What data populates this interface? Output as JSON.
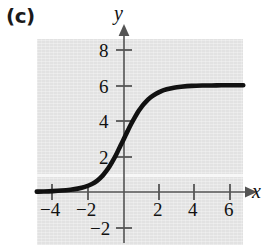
{
  "figure": {
    "panel_label": "(c)",
    "background_color": "#ffffff",
    "plot_background_color": "#e2e2e2",
    "curve_color": "#111111",
    "axis_color": "#555555"
  },
  "axes": {
    "x_name": "x",
    "y_name": "y",
    "x_ticks": [
      {
        "value": -4,
        "label": "−4"
      },
      {
        "value": -2,
        "label": "−2"
      },
      {
        "value": 2,
        "label": "2"
      },
      {
        "value": 4,
        "label": "4"
      },
      {
        "value": 6,
        "label": "6"
      }
    ],
    "y_ticks": [
      {
        "value": 8,
        "label": "8"
      },
      {
        "value": 6,
        "label": "6"
      },
      {
        "value": 4,
        "label": "4"
      },
      {
        "value": 2,
        "label": "2"
      },
      {
        "value": -2,
        "label": "−2"
      }
    ]
  },
  "chart_data": {
    "type": "line",
    "title": "(c)",
    "xlabel": "x",
    "ylabel": "y",
    "xlim": [
      -4.9,
      6.7
    ],
    "ylim": [
      -2.9,
      8.6
    ],
    "grid": false,
    "legend": null,
    "annotations": [],
    "asymptotes": {
      "lower": 0,
      "upper": 6
    },
    "y_intercept": 2.3,
    "series": [
      {
        "name": "logistic curve",
        "x": [
          -4.9,
          -4.5,
          -4.0,
          -3.5,
          -3.0,
          -2.6,
          -2.2,
          -1.8,
          -1.5,
          -1.2,
          -1.0,
          -0.8,
          -0.6,
          -0.4,
          -0.2,
          0.0,
          0.2,
          0.4,
          0.6,
          0.8,
          1.0,
          1.2,
          1.5,
          1.8,
          2.1,
          2.4,
          2.8,
          3.2,
          3.8,
          4.4,
          5.2,
          6.0,
          6.7
        ],
        "y": [
          0.02,
          0.03,
          0.05,
          0.08,
          0.13,
          0.19,
          0.29,
          0.45,
          0.64,
          0.92,
          1.17,
          1.46,
          1.8,
          2.18,
          2.6,
          3.0,
          3.42,
          3.82,
          4.18,
          4.52,
          4.8,
          5.04,
          5.32,
          5.52,
          5.67,
          5.77,
          5.86,
          5.91,
          5.96,
          5.98,
          5.99,
          6.0,
          6.0
        ]
      }
    ]
  }
}
